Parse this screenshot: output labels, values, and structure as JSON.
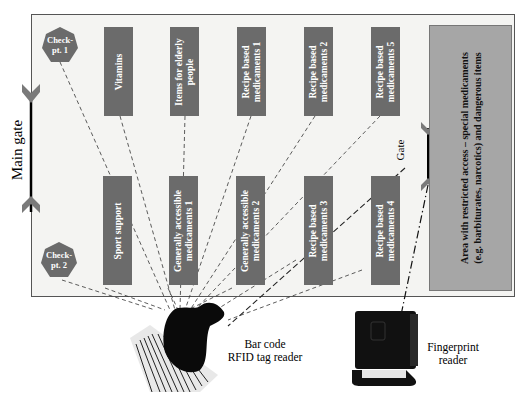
{
  "diagram": {
    "main_gate_label": "Main gate",
    "gate_label": "Gate",
    "checkpoints": [
      {
        "label_line1": "Check-",
        "label_line2": "pt. 1"
      },
      {
        "label_line1": "Check-",
        "label_line2": "pt. 2"
      }
    ],
    "shelves_top": [
      {
        "line1": "Vitamins",
        "line2": ""
      },
      {
        "line1": "Items for elderly",
        "line2": "people"
      },
      {
        "line1": "Recipe based",
        "line2": "medicaments 1"
      },
      {
        "line1": "Recipe based",
        "line2": "medicaments 2"
      },
      {
        "line1": "Recipe based",
        "line2": "medicaments 5"
      }
    ],
    "shelves_bottom": [
      {
        "line1": "Sport support",
        "line2": ""
      },
      {
        "line1": "Generally accessible",
        "line2": "medicaments 1"
      },
      {
        "line1": "Generally accessible",
        "line2": "medicaments 2"
      },
      {
        "line1": "Recipe based",
        "line2": "medicaments 3"
      },
      {
        "line1": "Recipe based",
        "line2": "medicaments 4"
      }
    ],
    "restricted_area": {
      "line1": "Area with restricted access – special medicaments",
      "line2": "(e.g. barbiturates, narcotics) and dangerous items"
    },
    "devices": {
      "barcode_reader": {
        "line1": "Bar code",
        "line2": "RFID tag reader"
      },
      "fingerprint_reader": {
        "line1": "Fingerprint",
        "line2": "reader"
      }
    },
    "colors": {
      "shelf": "#6b6b6b",
      "restricted": "#a6a6a6",
      "gate_chevron": "#7a7a7a",
      "store_bg": "#f4f4f2"
    }
  }
}
